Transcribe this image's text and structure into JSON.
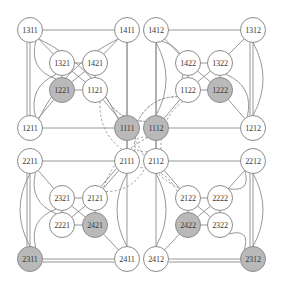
{
  "figure": {
    "name": "hypercube-graph-diagram",
    "width": 282,
    "height": 289,
    "node_radius": 12.5,
    "colors": {
      "background": "#ffffff",
      "edge": "#8c8c8c",
      "node_fill_plain": "#ffffff",
      "node_fill_shaded": "#b9b9b9",
      "node_stroke": "#8c8c8c",
      "label": "#3a3a3a"
    }
  },
  "nodes": [
    {
      "id": "1311",
      "label": "1311",
      "x": 30,
      "y": 30,
      "shaded": false
    },
    {
      "id": "1411",
      "label": "1411",
      "x": 127,
      "y": 30,
      "shaded": false
    },
    {
      "id": "1412",
      "label": "1412",
      "x": 156,
      "y": 30,
      "shaded": false
    },
    {
      "id": "1312",
      "label": "1312",
      "x": 253,
      "y": 30,
      "shaded": false
    },
    {
      "id": "1321",
      "label": "1321",
      "x": 62,
      "y": 63,
      "shaded": false
    },
    {
      "id": "1421",
      "label": "1421",
      "x": 95,
      "y": 63,
      "shaded": false
    },
    {
      "id": "1422",
      "label": "1422",
      "x": 188,
      "y": 63,
      "shaded": false
    },
    {
      "id": "1322",
      "label": "1322",
      "x": 220,
      "y": 63,
      "shaded": false
    },
    {
      "id": "1221",
      "label": "1221",
      "x": 62,
      "y": 90,
      "shaded": true
    },
    {
      "id": "1121",
      "label": "1121",
      "x": 95,
      "y": 90,
      "shaded": false
    },
    {
      "id": "1122",
      "label": "1122",
      "x": 188,
      "y": 90,
      "shaded": false
    },
    {
      "id": "1222",
      "label": "1222",
      "x": 220,
      "y": 90,
      "shaded": true
    },
    {
      "id": "1211",
      "label": "1211",
      "x": 30,
      "y": 128,
      "shaded": false
    },
    {
      "id": "1111",
      "label": "1111",
      "x": 127,
      "y": 128,
      "shaded": true
    },
    {
      "id": "1112",
      "label": "1112",
      "x": 156,
      "y": 128,
      "shaded": true
    },
    {
      "id": "1212",
      "label": "1212",
      "x": 253,
      "y": 128,
      "shaded": false
    },
    {
      "id": "2211",
      "label": "2211",
      "x": 30,
      "y": 161,
      "shaded": false
    },
    {
      "id": "2111",
      "label": "2111",
      "x": 127,
      "y": 161,
      "shaded": false
    },
    {
      "id": "2112",
      "label": "2112",
      "x": 156,
      "y": 161,
      "shaded": false
    },
    {
      "id": "2212",
      "label": "2212",
      "x": 253,
      "y": 161,
      "shaded": false
    },
    {
      "id": "2321",
      "label": "2321",
      "x": 62,
      "y": 198,
      "shaded": false
    },
    {
      "id": "2121",
      "label": "2121",
      "x": 95,
      "y": 198,
      "shaded": false
    },
    {
      "id": "2122",
      "label": "2122",
      "x": 188,
      "y": 198,
      "shaded": false
    },
    {
      "id": "2222",
      "label": "2222",
      "x": 220,
      "y": 198,
      "shaded": false
    },
    {
      "id": "2221",
      "label": "2221",
      "x": 62,
      "y": 225,
      "shaded": false
    },
    {
      "id": "2421",
      "label": "2421",
      "x": 95,
      "y": 225,
      "shaded": true
    },
    {
      "id": "2422",
      "label": "2422",
      "x": 188,
      "y": 225,
      "shaded": true
    },
    {
      "id": "2322",
      "label": "2322",
      "x": 220,
      "y": 225,
      "shaded": false
    },
    {
      "id": "2311",
      "label": "2311",
      "x": 30,
      "y": 259,
      "shaded": true
    },
    {
      "id": "2411",
      "label": "2411",
      "x": 127,
      "y": 259,
      "shaded": false
    },
    {
      "id": "2412",
      "label": "2412",
      "x": 156,
      "y": 259,
      "shaded": false
    },
    {
      "id": "2312",
      "label": "2312",
      "x": 253,
      "y": 259,
      "shaded": true
    }
  ],
  "edges_straight": [
    [
      "1311",
      "1411"
    ],
    [
      "1311",
      "1211"
    ],
    [
      "1311",
      "1211"
    ],
    [
      "1411",
      "1111"
    ],
    [
      "1211",
      "1111"
    ],
    [
      "1321",
      "1421"
    ],
    [
      "1321",
      "1221"
    ],
    [
      "1421",
      "1121"
    ],
    [
      "1221",
      "1121"
    ],
    [
      "1321",
      "1121"
    ],
    [
      "1421",
      "1221"
    ],
    [
      "1121",
      "1111"
    ],
    [
      "1311",
      "1321"
    ],
    [
      "1411",
      "1421"
    ],
    [
      "1221",
      "1211"
    ],
    [
      "1412",
      "1312"
    ],
    [
      "1412",
      "1112"
    ],
    [
      "1312",
      "1212"
    ],
    [
      "1312",
      "1212"
    ],
    [
      "1112",
      "1212"
    ],
    [
      "1422",
      "1322"
    ],
    [
      "1422",
      "1122"
    ],
    [
      "1322",
      "1222"
    ],
    [
      "1122",
      "1222"
    ],
    [
      "1422",
      "1222"
    ],
    [
      "1322",
      "1122"
    ],
    [
      "1122",
      "1112"
    ],
    [
      "1412",
      "1422"
    ],
    [
      "1312",
      "1322"
    ],
    [
      "1222",
      "1212"
    ],
    [
      "2211",
      "2111"
    ],
    [
      "2211",
      "2311"
    ],
    [
      "2211",
      "2311"
    ],
    [
      "2111",
      "2411"
    ],
    [
      "2311",
      "2411"
    ],
    [
      "2311",
      "2411"
    ],
    [
      "2321",
      "2121"
    ],
    [
      "2321",
      "2221"
    ],
    [
      "2121",
      "2421"
    ],
    [
      "2221",
      "2421"
    ],
    [
      "2321",
      "2421"
    ],
    [
      "2121",
      "2221"
    ],
    [
      "2121",
      "2111"
    ],
    [
      "2211",
      "2321"
    ],
    [
      "2111",
      "2121"
    ],
    [
      "2421",
      "2411"
    ],
    [
      "2112",
      "2212"
    ],
    [
      "2112",
      "2412"
    ],
    [
      "2212",
      "2312"
    ],
    [
      "2212",
      "2312"
    ],
    [
      "2412",
      "2312"
    ],
    [
      "2412",
      "2312"
    ],
    [
      "2122",
      "2222"
    ],
    [
      "2122",
      "2422"
    ],
    [
      "2222",
      "2322"
    ],
    [
      "2422",
      "2322"
    ],
    [
      "2122",
      "2322"
    ],
    [
      "2222",
      "2422"
    ],
    [
      "2122",
      "2112"
    ],
    [
      "2222",
      "2212"
    ],
    [
      "2422",
      "2412"
    ],
    [
      "1111",
      "2111"
    ],
    [
      "1112",
      "2112"
    ],
    [
      "1411",
      "2111"
    ],
    [
      "1412",
      "2112"
    ]
  ],
  "edges_curved": [
    [
      "1311",
      "1111"
    ],
    [
      "1411",
      "1211"
    ],
    [
      "1211",
      "1321"
    ],
    [
      "1311",
      "1221"
    ],
    [
      "1412",
      "1112"
    ],
    [
      "1312",
      "1212"
    ],
    [
      "1212",
      "1322"
    ],
    [
      "1412",
      "1122"
    ],
    [
      "2211",
      "2311"
    ],
    [
      "2111",
      "2411"
    ],
    [
      "2311",
      "2321"
    ],
    [
      "2211",
      "2221"
    ],
    [
      "2212",
      "2312"
    ],
    [
      "2112",
      "2412"
    ],
    [
      "2312",
      "2322"
    ],
    [
      "2212",
      "2222"
    ]
  ],
  "edges_dashed": [
    [
      "1121",
      "1112"
    ],
    [
      "1122",
      "1111"
    ],
    [
      "1111",
      "2112"
    ],
    [
      "1112",
      "2111"
    ],
    [
      "1111",
      "2122"
    ],
    [
      "1112",
      "2121"
    ],
    [
      "2121",
      "2112"
    ],
    [
      "2122",
      "2111"
    ],
    [
      "1121",
      "2111"
    ],
    [
      "1122",
      "2112"
    ],
    [
      "1111",
      "1122"
    ],
    [
      "1112",
      "1121"
    ]
  ]
}
